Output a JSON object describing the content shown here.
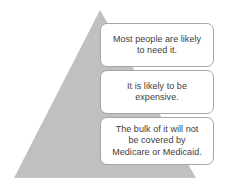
{
  "diagram": {
    "type": "pyramid-with-callouts",
    "shape": {
      "name": "gray-pyramid",
      "fill_color": "#c0c0c0",
      "apex": {
        "x": 100,
        "y": 10
      },
      "base_left": {
        "x": 14,
        "y": 178
      },
      "base_right": {
        "x": 196,
        "y": 178
      }
    },
    "callouts": [
      {
        "id": "callout-1",
        "text": "Most people are likely\nto need it.",
        "border_color": "#a6a6a6",
        "background_color": "#ffffff",
        "text_color": "#404040"
      },
      {
        "id": "callout-2",
        "text": "It is likely to be\nexpensive.",
        "border_color": "#a6a6a6",
        "background_color": "#ffffff",
        "text_color": "#404040"
      },
      {
        "id": "callout-3",
        "text": "The bulk of it will not\nbe covered by\nMedicare or Medicaid.",
        "border_color": "#a6a6a6",
        "background_color": "#ffffff",
        "text_color": "#404040"
      }
    ]
  }
}
